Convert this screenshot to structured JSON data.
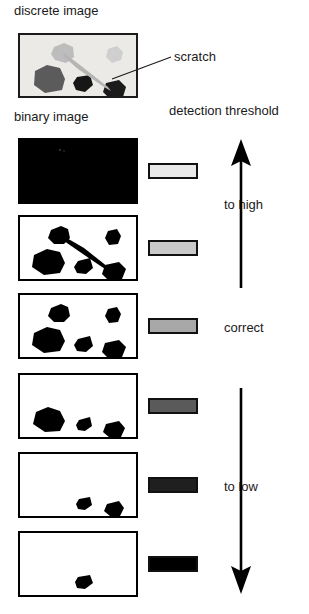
{
  "figure": {
    "title_labels": {
      "discrete_image": "discrete image",
      "binary_image": "binary image",
      "detection_threshold": "detection threshold",
      "scratch": "scratch",
      "to_high": "to high",
      "correct": "correct",
      "to_low": "to low"
    },
    "colors": {
      "ink": "#000000",
      "text": "#1a1a1a",
      "panel_background": "#ffffff",
      "gray_image_background": "#eceae7",
      "panel_border": "#000000"
    },
    "source_image": {
      "name": "discrete-image-panel",
      "background": "#eceae7",
      "border_color": "#1b1b1b",
      "blobs": [
        {
          "id": "blob-light-top-left",
          "fill": "#bdbdbd",
          "points": "34,12 44,8 53,12 54,22 46,28 35,25 31,19"
        },
        {
          "id": "blob-light-top-right",
          "fill": "#cfcfcf",
          "points": "88,14 97,11 103,17 101,25 92,28 86,22"
        },
        {
          "id": "blob-dark-left",
          "fill": "#5b5b5b",
          "points": "15,36 27,30 40,33 45,44 42,55 25,58 14,50"
        },
        {
          "id": "blob-black-mid",
          "fill": "#161616",
          "points": "57,42 70,40 73,50 65,57 56,55 53,48"
        },
        {
          "id": "blob-black-right",
          "fill": "#1b1b1b",
          "points": "86,48 99,45 106,52 103,62 90,64 83,57"
        }
      ],
      "scratch_stroke": "#b5b5b5"
    },
    "leader_line": {
      "name": "scratch-leader-line",
      "x1": 112,
      "y1": 79,
      "x2": 171,
      "y2": 57
    },
    "panels": [
      {
        "id": "panel-1",
        "threshold_label": "to high",
        "all_black": true,
        "swatch_fill": "#e8e8e8",
        "top": 138,
        "swatch_top": 163,
        "blobs": [],
        "scratch": null
      },
      {
        "id": "panel-2",
        "threshold_label": "to high",
        "all_black": false,
        "swatch_fill": "#c9c9c9",
        "top": 215,
        "swatch_top": 240,
        "blobs": [
          "31,13 41,9 48,12 50,21 44,27 34,27 28,21",
          "88,14 97,12 101,19 98,27 89,28 85,21",
          "14,38 27,32 40,35 45,46 40,56 24,58 12,50",
          "58,44 70,41 73,51 66,57 57,56 54,50",
          "85,48 99,45 106,52 102,62 89,64 82,57"
        ],
        "scratch": "45,21 62,31 86,49 90,54 82,49 62,36 45,25"
      },
      {
        "id": "panel-3",
        "threshold_label": "correct",
        "all_black": false,
        "swatch_fill": "#a8a8a8",
        "top": 293,
        "swatch_top": 318,
        "blobs": [
          "31,13 41,9 48,12 50,21 44,27 34,27 28,21",
          "88,14 97,12 101,19 98,27 89,28 85,21",
          "14,38 27,32 40,35 45,46 40,56 24,58 12,50",
          "58,44 70,41 73,51 66,57 57,56 54,50",
          "85,48 99,45 106,52 102,62 89,64 82,57"
        ],
        "scratch": null
      },
      {
        "id": "panel-4",
        "threshold_label": "to low",
        "all_black": false,
        "swatch_fill": "#5a5a5a",
        "top": 373,
        "swatch_top": 398,
        "blobs": [
          "16,37 28,32 40,36 45,46 40,56 25,57 13,49",
          "59,45 70,42 72,51 65,56 58,55 56,50",
          "86,49 99,46 105,53 101,62 90,63 83,57"
        ],
        "scratch": null
      },
      {
        "id": "panel-5",
        "threshold_label": "to low",
        "all_black": false,
        "swatch_fill": "#1f1f1f",
        "top": 452,
        "swatch_top": 477,
        "blobs": [
          "59,45 70,43 72,51 65,56 58,55 56,50",
          "87,50 99,47 104,54 100,62 90,62 84,57"
        ],
        "scratch": null
      },
      {
        "id": "panel-6",
        "threshold_label": "to low",
        "all_black": false,
        "swatch_fill": "#000000",
        "top": 531,
        "swatch_top": 556,
        "blobs": [
          "58,44 70,42 73,50 65,56 57,55 55,49"
        ],
        "scratch": null
      }
    ],
    "arrows": [
      {
        "name": "arrow-up-to-high",
        "direction": "up",
        "x": 240,
        "y_top": 140,
        "y_bottom": 288
      },
      {
        "name": "arrow-down-to-low",
        "direction": "down",
        "x": 240,
        "y_top": 388,
        "y_bottom": 594
      }
    ]
  }
}
